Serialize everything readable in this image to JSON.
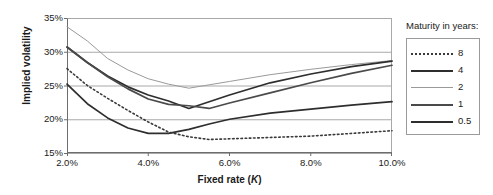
{
  "chart_data": {
    "type": "line",
    "title": "",
    "xlabel": "Fixed rate (K)",
    "ylabel": "Implied volatility",
    "xlim": [
      2.0,
      10.0
    ],
    "ylim": [
      15,
      35
    ],
    "xticks": [
      "2.0%",
      "4.0%",
      "6.0%",
      "8.0%",
      "10.0%"
    ],
    "xtick_values": [
      2.0,
      4.0,
      6.0,
      8.0,
      10.0
    ],
    "yticks": [
      "15%",
      "20%",
      "25%",
      "30%",
      "35%"
    ],
    "ytick_values": [
      15,
      20,
      25,
      30,
      35
    ],
    "grid": "horizontal",
    "legend_position": "right",
    "legend_title": "Maturity in years:",
    "x": [
      2.0,
      2.5,
      3.0,
      3.5,
      4.0,
      4.5,
      5.0,
      5.5,
      6.0,
      7.0,
      8.0,
      9.0,
      10.0
    ],
    "series": [
      {
        "name": "8",
        "style": "dotted",
        "color": "#3a3a3a",
        "width": 1.6,
        "values": [
          27.5,
          25.0,
          23.1,
          21.3,
          19.6,
          18.1,
          17.4,
          17.0,
          17.1,
          17.3,
          17.5,
          17.9,
          18.3
        ]
      },
      {
        "name": "4",
        "style": "solid",
        "color": "#2e2e2e",
        "width": 1.7,
        "values": [
          30.7,
          28.4,
          26.4,
          24.8,
          23.6,
          22.7,
          21.6,
          22.6,
          23.6,
          25.4,
          26.7,
          27.8,
          28.6
        ]
      },
      {
        "name": "2",
        "style": "solid",
        "color": "#9a9a9a",
        "width": 1.0,
        "values": [
          33.7,
          31.6,
          29.0,
          27.3,
          26.0,
          25.2,
          24.6,
          25.1,
          25.6,
          26.6,
          27.4,
          28.1,
          28.7
        ]
      },
      {
        "name": "1",
        "style": "solid",
        "color": "#4a4a4a",
        "width": 1.7,
        "values": [
          30.7,
          28.4,
          26.3,
          24.5,
          23.0,
          22.2,
          22.0,
          21.6,
          22.4,
          23.9,
          25.4,
          26.8,
          28.0
        ]
      },
      {
        "name": "0.5",
        "style": "solid",
        "color": "#2e2e2e",
        "width": 1.7,
        "values": [
          25.2,
          22.3,
          20.2,
          18.7,
          17.9,
          17.9,
          18.5,
          19.3,
          20.0,
          20.9,
          21.5,
          22.1,
          22.6
        ]
      }
    ]
  },
  "legend": {
    "title": "Maturity in years:",
    "items": [
      {
        "label": "8"
      },
      {
        "label": "4"
      },
      {
        "label": "2"
      },
      {
        "label": "1"
      },
      {
        "label": "0.5"
      }
    ]
  },
  "axes": {
    "x_title_prefix": "Fixed rate (",
    "x_title_italic": "K",
    "x_title_suffix": ")",
    "y_title": "Implied volatility"
  }
}
